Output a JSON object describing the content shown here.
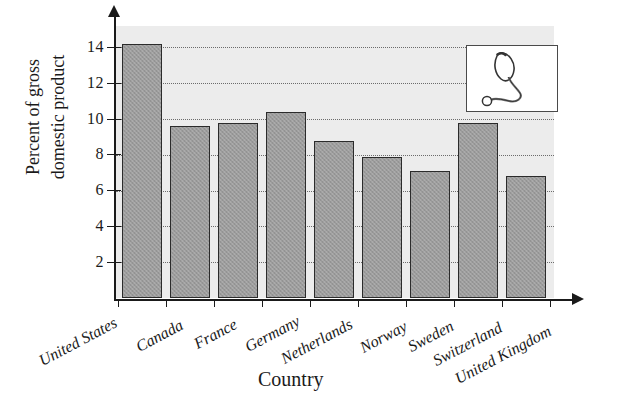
{
  "chart_data": {
    "type": "bar",
    "title": "",
    "subtitle": "",
    "xlabel": "Country",
    "ylabel_lines": [
      "Percent of gross",
      "domestic product"
    ],
    "ylabel": "Percent of gross domestic product",
    "categories": [
      "United States",
      "Canada",
      "France",
      "Germany",
      "Netherlands",
      "Norway",
      "Sweden",
      "Switzerland",
      "United Kingdom"
    ],
    "values": [
      14.2,
      9.6,
      9.8,
      10.4,
      8.8,
      7.9,
      7.1,
      9.8,
      6.8
    ],
    "ylim": [
      0,
      15.2
    ],
    "yticks": [
      2,
      4,
      6,
      8,
      10,
      12,
      14
    ],
    "ytick_labels": [
      "2",
      "4",
      "6",
      "8",
      "10",
      "12",
      "14"
    ],
    "grid": true,
    "grid_axis": "y",
    "legend": false,
    "legend_position": "none",
    "bar_fill_color": "#9b9b9b",
    "bar_edge_color": "#2b2b2b",
    "plot_background_color": "#ececec",
    "axis_color": "#1a1a1a"
  },
  "inset": {
    "name": "stethoscope-illustration",
    "border_color": "#4a4a4a",
    "background_color": "#ffffff"
  }
}
